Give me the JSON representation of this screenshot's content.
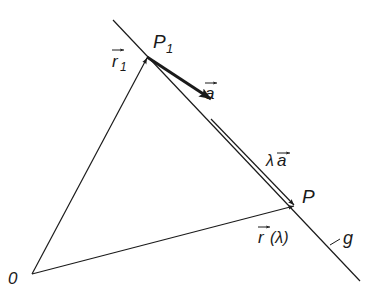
{
  "diagram": {
    "labels": {
      "origin": "0",
      "point_p1": "P",
      "point_p1_sub": "1",
      "point_p": "P",
      "line": "g",
      "vec_r1": "r",
      "vec_r1_sub": "1",
      "vec_a": "a",
      "vec_lambda_a_lambda": "λ",
      "vec_lambda_a": "a",
      "vec_r_lambda": "r",
      "vec_r_lambda_arg": "(λ)"
    },
    "points": {
      "O": [
        32,
        274
      ],
      "P1": [
        147,
        57
      ],
      "P": [
        294,
        205
      ]
    },
    "colors": {
      "stroke": "#1a1a1a",
      "background": "#ffffff"
    }
  }
}
